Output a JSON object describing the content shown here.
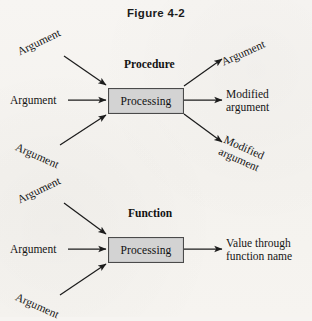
{
  "figure": {
    "title": "Figure 4-2",
    "background_color": "#f6f4f1",
    "box_fill_color": "#d3d3d3",
    "box_border_color": "#4a4a4a",
    "line_color": "#1c1c1c"
  },
  "procedure_diagram": {
    "heading": "Procedure",
    "box_label": "Processing",
    "inputs": [
      {
        "label": "Argument",
        "position": "top-left",
        "rotation_deg": -26
      },
      {
        "label": "Argument",
        "position": "middle-left",
        "rotation_deg": 0
      },
      {
        "label": "Argument",
        "position": "bottom-left",
        "rotation_deg": 24
      }
    ],
    "outputs": [
      {
        "label": "Argument",
        "position": "top-right",
        "rotation_deg": -24
      },
      {
        "label_line1": "Modified",
        "label_line2": "argument",
        "position": "middle-right",
        "rotation_deg": 0
      },
      {
        "label_line1": "Modified",
        "label_line2": "argument",
        "position": "bottom-right",
        "rotation_deg": 24
      }
    ]
  },
  "function_diagram": {
    "heading": "Function",
    "box_label": "Processing",
    "inputs": [
      {
        "label": "Argument",
        "position": "top-left",
        "rotation_deg": -26
      },
      {
        "label": "Argument",
        "position": "middle-left",
        "rotation_deg": 0
      },
      {
        "label": "Argument",
        "position": "bottom-left",
        "rotation_deg": 24
      }
    ],
    "outputs": [
      {
        "label_line1": "Value through",
        "label_line2": "function name",
        "position": "middle-right",
        "rotation_deg": 0
      }
    ]
  }
}
